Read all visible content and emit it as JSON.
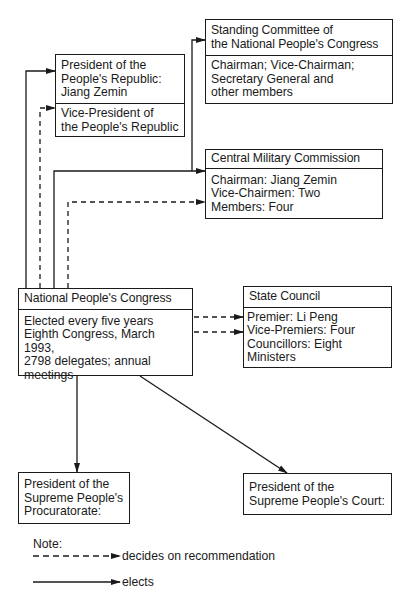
{
  "boxes": {
    "president": {
      "title": "President of the\nPeople's Republic:\nJiang Zemin",
      "sub": "Vice-President of\nthe People's Republic"
    },
    "standing_committee": {
      "title": "Standing Committee of\nthe National People's Congress",
      "body": "Chairman; Vice-Chairman;\nSecretary General and\nother members"
    },
    "cmc": {
      "title": "Central Military Commission",
      "body": "Chairman: Jiang Zemin\nVice-Chairmen: Two\nMembers: Four"
    },
    "npc": {
      "title": "National People's Congress",
      "body": "Elected every five years\nEighth Congress, March 1993,\n2798 delegates; annual\nmeetings"
    },
    "state_council": {
      "title": "State Council",
      "body": "Premier: Li Peng\nVice-Premiers: Four\nCouncillors: Eight\nMinisters"
    },
    "procuratorate": {
      "title": "President of the\nSupreme People's\nProcuratorate:"
    },
    "court": {
      "title": "President of the\nSupreme People's Court:"
    }
  },
  "legend": {
    "title": "Note:",
    "dashed": "decides on recommendation",
    "solid": "elects"
  },
  "colors": {
    "ink": "#1a1a1a",
    "background": "#ffffff"
  }
}
